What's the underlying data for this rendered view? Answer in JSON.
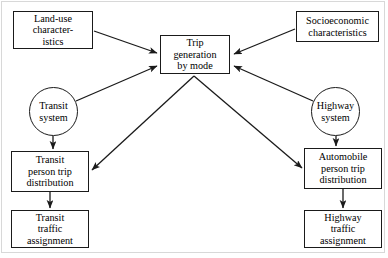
{
  "diagram": {
    "stroke_color": "#1a1a1a",
    "background_color": "#ffffff",
    "frame_color": "#d8d8d8",
    "nodes": {
      "landuse": {
        "label": "Land-use\ncharacter-\nistics",
        "shape": "rectangle"
      },
      "socioeconomic": {
        "label": "Socioeconomic\ncharacteristics",
        "shape": "rectangle"
      },
      "trip_generation": {
        "label": "Trip\ngeneration\nby mode",
        "shape": "rectangle"
      },
      "transit_system": {
        "label": "Transit\nsystem",
        "shape": "circle"
      },
      "highway_system": {
        "label": "Highway\nsystem",
        "shape": "circle"
      },
      "transit_distribution": {
        "label": "Transit\nperson trip\ndistribution",
        "shape": "rectangle"
      },
      "automobile_distribution": {
        "label": "Automobile\nperson trip\ndistribution",
        "shape": "rectangle"
      },
      "transit_assignment": {
        "label": "Transit\ntraffic\nassignment",
        "shape": "rectangle"
      },
      "highway_assignment": {
        "label": "Highway\ntraffic\nassignment",
        "shape": "rectangle"
      }
    },
    "edges": [
      {
        "from": "landuse",
        "to": "trip_generation"
      },
      {
        "from": "socioeconomic",
        "to": "trip_generation"
      },
      {
        "from": "transit_system",
        "to": "trip_generation"
      },
      {
        "from": "highway_system",
        "to": "trip_generation"
      },
      {
        "from": "transit_system",
        "to": "transit_distribution"
      },
      {
        "from": "highway_system",
        "to": "automobile_distribution"
      },
      {
        "from": "trip_generation",
        "to": "transit_distribution"
      },
      {
        "from": "trip_generation",
        "to": "automobile_distribution"
      },
      {
        "from": "transit_distribution",
        "to": "transit_assignment"
      },
      {
        "from": "automobile_distribution",
        "to": "highway_assignment"
      }
    ]
  }
}
